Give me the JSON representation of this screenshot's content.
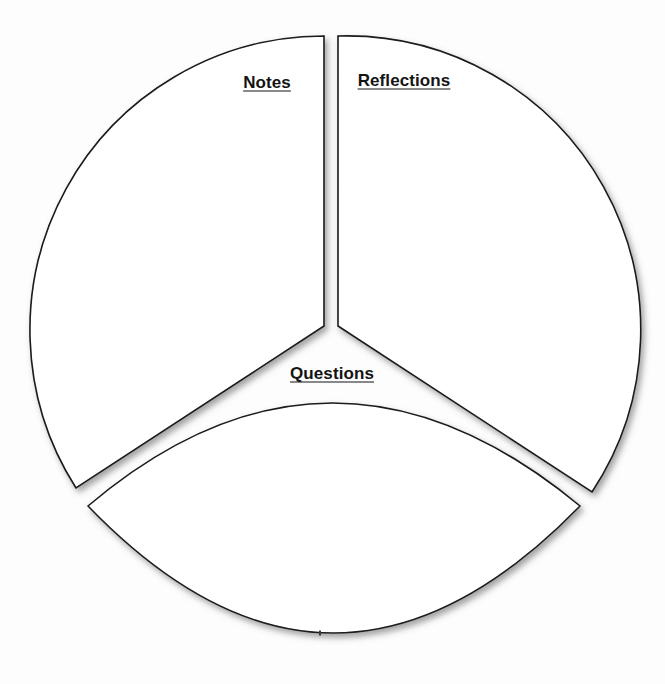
{
  "diagram": {
    "type": "circle-three-segment",
    "title": "",
    "background_color": "#fdfdfd",
    "outline_color": "#1a1a1a",
    "fill_color": "#ffffff",
    "label_color": "#141414",
    "geometry": {
      "circle_center_x": 331,
      "circle_center_y": 330,
      "circle_radius": 294,
      "lens_left_vertex_x": 88,
      "lens_left_vertex_y": 506,
      "lens_right_vertex_x": 580,
      "lens_right_vertex_y": 506,
      "lens_bottom_y": 634,
      "divider_gap_px": 14
    },
    "segments": [
      {
        "id": "notes",
        "label": "Notes",
        "position": "upper-left",
        "label_x": 267,
        "label_y": 82
      },
      {
        "id": "reflections",
        "label": "Reflections",
        "position": "upper-right",
        "label_x": 404,
        "label_y": 80
      },
      {
        "id": "questions",
        "label": "Questions",
        "position": "bottom",
        "label_x": 332,
        "label_y": 373
      }
    ],
    "bottom_tick_x": 320,
    "bottom_tick_y": 633
  }
}
